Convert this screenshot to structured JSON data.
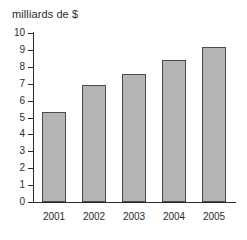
{
  "chart_data": {
    "type": "bar",
    "title": "milliards de $",
    "xlabel": "",
    "ylabel": "milliards de $",
    "categories": [
      "2001",
      "2002",
      "2003",
      "2004",
      "2005"
    ],
    "values": [
      5.3,
      6.95,
      7.55,
      8.4,
      9.2
    ],
    "ylim": [
      0,
      10
    ],
    "ytick_labels": [
      "0",
      "1",
      "2",
      "3",
      "4",
      "5",
      "6",
      "7",
      "8",
      "9",
      "10"
    ],
    "ytick_values": [
      0,
      1,
      2,
      3,
      4,
      5,
      6,
      7,
      8,
      9,
      10
    ],
    "grid": false,
    "legend": null,
    "bar_color": "#b5b5b5",
    "bar_edge_color": "#4a4a4a",
    "axis_color": "#2b2b2b",
    "background": "#ffffff"
  }
}
